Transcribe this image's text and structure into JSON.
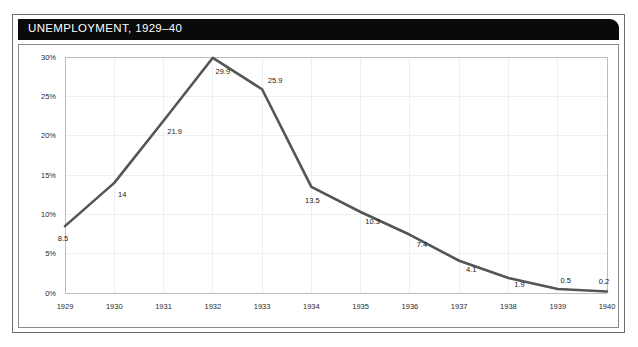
{
  "figure": {
    "title": "UNEMPLOYMENT, 1929–40",
    "background": "#ffffff",
    "banner_color": "#0a0a0a",
    "banner_text_color": "#ffffff",
    "frame_color": "#6f6f6f"
  },
  "chart_data": {
    "type": "line",
    "title": "UNEMPLOYMENT, 1929–40",
    "xlabel": "",
    "ylabel": "",
    "categories": [
      "1929",
      "1930",
      "1931",
      "1932",
      "1933",
      "1934",
      "1935",
      "1936",
      "1937",
      "1938",
      "1939",
      "1940"
    ],
    "values": [
      8.5,
      14,
      21.9,
      29.9,
      25.9,
      13.5,
      10.3,
      7.4,
      4.1,
      1.9,
      0.5,
      0.2
    ],
    "point_labels": [
      "8.5",
      "14",
      "21.9",
      "29.9",
      "25.9",
      "13.5",
      "10.3",
      "7.4",
      "4.1",
      "1.9",
      "0.5",
      "0.2"
    ],
    "ylim": [
      0,
      30
    ],
    "xlim": [
      "1929",
      "1940"
    ],
    "ytick_values": [
      0,
      5,
      10,
      15,
      20,
      25,
      30
    ],
    "ytick_labels": [
      "0%",
      "5%",
      "10%",
      "15%",
      "20%",
      "25%",
      "30%"
    ],
    "xtick_labels": [
      "1929",
      "1930",
      "1931",
      "1932",
      "1933",
      "1934",
      "1935",
      "1936",
      "1937",
      "1938",
      "1939",
      "1940"
    ],
    "grid": true,
    "legend": false,
    "series_color": "#555555",
    "grid_color": "#eceff4",
    "axis_color": "#b9bdc4"
  }
}
